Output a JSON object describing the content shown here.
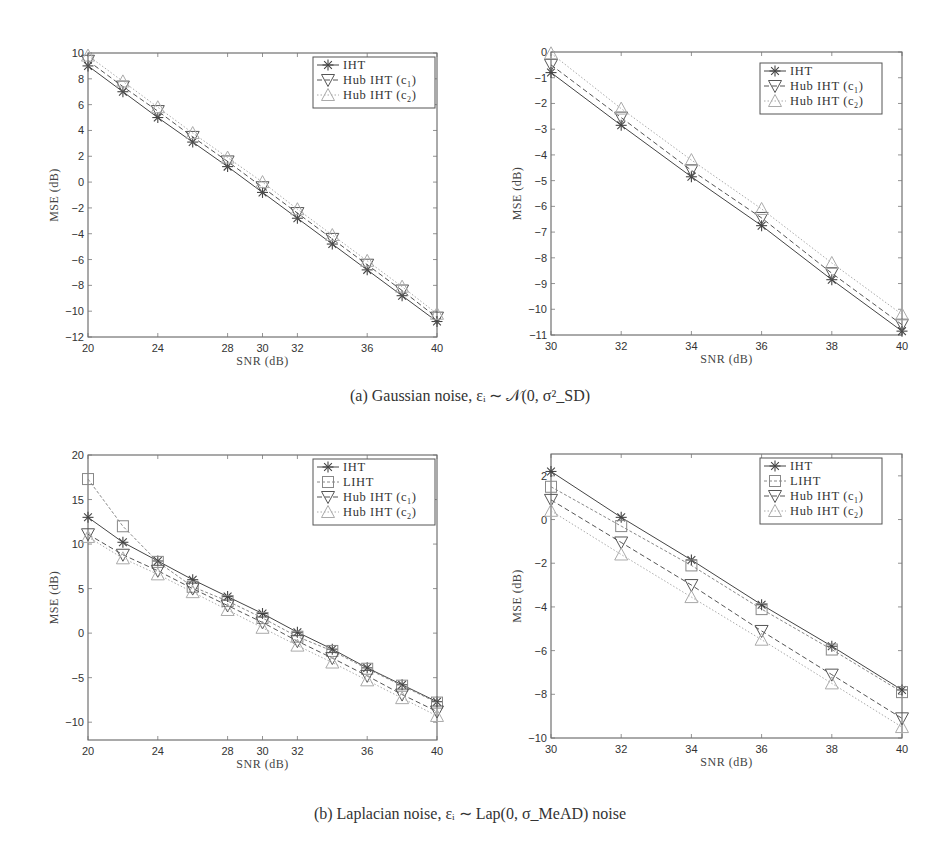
{
  "captions": {
    "a": "(a) Gaussian noise, εᵢ ∼ 𝒩(0, σ²_SD)",
    "b": "(b) Laplacian noise, εᵢ ∼ Lap(0, σ_MeAD) noise"
  },
  "styles": {
    "IHT": {
      "color": "#444444",
      "dash": "",
      "marker": "star"
    },
    "LIHT": {
      "color": "#888888",
      "dash": "3,2",
      "marker": "square"
    },
    "Hub IHT (c1)": {
      "color": "#555555",
      "dash": "5,3",
      "marker": "tri-down"
    },
    "Hub IHT (c2)": {
      "color": "#aaaaaa",
      "dash": "1.5,2",
      "marker": "tri-up"
    }
  },
  "chart_data": [
    {
      "id": "a-left",
      "type": "line",
      "title": "",
      "xlabel": "SNR (dB)",
      "ylabel": "MSE (dB)",
      "xlim": [
        20,
        40
      ],
      "ylim": [
        -12,
        10
      ],
      "xticks": [
        20,
        24,
        28,
        30,
        32,
        36,
        40
      ],
      "yticks": [
        10,
        8,
        6,
        4,
        2,
        0,
        -2,
        -4,
        -6,
        -8,
        -10,
        -12
      ],
      "legend_position": "upper right",
      "grid": false,
      "x": [
        20,
        22,
        24,
        26,
        28,
        30,
        32,
        34,
        36,
        38,
        40
      ],
      "series": [
        {
          "name": "IHT",
          "label_main": "IHT",
          "label_sub": "",
          "values": [
            9.0,
            7.0,
            5.0,
            3.1,
            1.2,
            -0.8,
            -2.8,
            -4.8,
            -6.8,
            -8.8,
            -10.8
          ]
        },
        {
          "name": "Hub IHT (c1)",
          "label_main": "Hub IHT (c",
          "label_sub": "1",
          "values": [
            9.4,
            7.4,
            5.5,
            3.5,
            1.6,
            -0.4,
            -2.4,
            -4.4,
            -6.4,
            -8.4,
            -10.5
          ]
        },
        {
          "name": "Hub IHT (c2)",
          "label_main": "Hub IHT (c",
          "label_sub": "2",
          "values": [
            9.8,
            7.8,
            5.8,
            3.8,
            1.9,
            0.0,
            -2.1,
            -4.1,
            -6.1,
            -8.1,
            -10.2
          ]
        }
      ]
    },
    {
      "id": "a-right",
      "type": "line",
      "title": "",
      "xlabel": "SNR (dB)",
      "ylabel": "MSE (dB)",
      "xlim": [
        30,
        40
      ],
      "ylim": [
        -11,
        0
      ],
      "xticks": [
        30,
        32,
        34,
        36,
        38,
        40
      ],
      "yticks": [
        0,
        -1,
        -2,
        -3,
        -4,
        -5,
        -6,
        -7,
        -8,
        -9,
        -10,
        -11
      ],
      "legend_position": "upper right",
      "grid": false,
      "x": [
        30,
        32,
        34,
        36,
        38,
        40
      ],
      "series": [
        {
          "name": "IHT",
          "label_main": "IHT",
          "label_sub": "",
          "values": [
            -0.8,
            -2.85,
            -4.85,
            -6.75,
            -8.85,
            -10.85
          ]
        },
        {
          "name": "Hub IHT (c1)",
          "label_main": "Hub IHT (c",
          "label_sub": "1",
          "values": [
            -0.5,
            -2.55,
            -4.6,
            -6.45,
            -8.6,
            -10.6
          ]
        },
        {
          "name": "Hub IHT (c2)",
          "label_main": "Hub IHT (c",
          "label_sub": "2",
          "values": [
            -0.05,
            -2.2,
            -4.2,
            -6.1,
            -8.2,
            -10.2
          ]
        }
      ]
    },
    {
      "id": "b-left",
      "type": "line",
      "title": "",
      "xlabel": "SNR (dB)",
      "ylabel": "MSE (dB)",
      "xlim": [
        20,
        40
      ],
      "ylim": [
        -12,
        20
      ],
      "xticks": [
        20,
        24,
        28,
        30,
        32,
        36,
        40
      ],
      "yticks": [
        20,
        15,
        10,
        5,
        0,
        -5,
        -10
      ],
      "legend_position": "upper right",
      "grid": false,
      "x": [
        20,
        22,
        24,
        26,
        28,
        30,
        32,
        34,
        36,
        38,
        40
      ],
      "series": [
        {
          "name": "IHT",
          "label_main": "IHT",
          "label_sub": "",
          "values": [
            13.0,
            10.2,
            8.1,
            6.0,
            4.1,
            2.2,
            0.1,
            -1.8,
            -3.9,
            -5.8,
            -7.7
          ]
        },
        {
          "name": "LIHT",
          "label_main": "LIHT",
          "label_sub": "",
          "values": [
            17.3,
            12.0,
            8.0,
            5.2,
            3.6,
            1.7,
            -0.4,
            -2.0,
            -4.0,
            -5.9,
            -7.8
          ]
        },
        {
          "name": "Hub IHT (c1)",
          "label_main": "Hub IHT (c",
          "label_sub": "1",
          "values": [
            11.1,
            8.8,
            7.0,
            5.0,
            3.1,
            1.2,
            -0.9,
            -2.8,
            -4.8,
            -6.9,
            -8.8
          ]
        },
        {
          "name": "Hub IHT (c2)",
          "label_main": "Hub IHT (c",
          "label_sub": "2",
          "values": [
            10.8,
            8.4,
            6.6,
            4.6,
            2.6,
            0.6,
            -1.4,
            -3.3,
            -5.3,
            -7.3,
            -9.3
          ]
        }
      ]
    },
    {
      "id": "b-right",
      "type": "line",
      "title": "",
      "xlabel": "SNR (dB)",
      "ylabel": "MSE (dB)",
      "xlim": [
        30,
        40
      ],
      "ylim": [
        -10,
        3
      ],
      "xticks": [
        30,
        32,
        34,
        36,
        38,
        40
      ],
      "yticks": [
        2,
        0,
        -2,
        -4,
        -6,
        -8,
        -10
      ],
      "legend_position": "upper right",
      "grid": false,
      "x": [
        30,
        32,
        34,
        36,
        38,
        40
      ],
      "series": [
        {
          "name": "IHT",
          "label_main": "IHT",
          "label_sub": "",
          "values": [
            2.2,
            0.1,
            -1.85,
            -3.9,
            -5.8,
            -7.8
          ]
        },
        {
          "name": "LIHT",
          "label_main": "LIHT",
          "label_sub": "",
          "values": [
            1.5,
            -0.3,
            -2.1,
            -4.1,
            -5.95,
            -7.9
          ]
        },
        {
          "name": "Hub IHT (c1)",
          "label_main": "Hub IHT (c",
          "label_sub": "1",
          "values": [
            0.9,
            -1.05,
            -3.0,
            -5.1,
            -7.1,
            -9.1
          ]
        },
        {
          "name": "Hub IHT (c2)",
          "label_main": "Hub IHT (c",
          "label_sub": "2",
          "values": [
            0.4,
            -1.6,
            -3.55,
            -5.5,
            -7.5,
            -9.5
          ]
        }
      ]
    }
  ]
}
